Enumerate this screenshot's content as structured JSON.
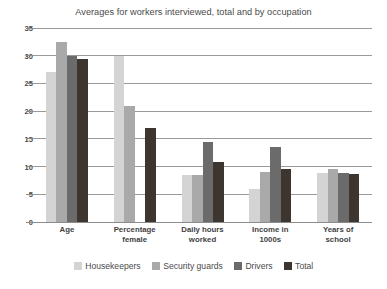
{
  "chart_data": {
    "type": "bar",
    "title": "Averages for workers interviewed, total and by occupation",
    "xlabel": "",
    "ylabel": "",
    "ylim": [
      0,
      35
    ],
    "ytick_step": 5,
    "yticks": [
      0,
      5,
      10,
      15,
      20,
      25,
      30,
      35
    ],
    "grid": true,
    "legend_position": "bottom",
    "orientation": "vertical",
    "grouped": true,
    "categories": [
      "Age",
      "Percentage female",
      "Daily hours worked",
      "Income in 1000s",
      "Years of school"
    ],
    "category_lines": [
      [
        "Age"
      ],
      [
        "Percentage",
        "female"
      ],
      [
        "Daily hours",
        "worked"
      ],
      [
        "Income in",
        "1000s"
      ],
      [
        "Years of",
        "school"
      ]
    ],
    "series": [
      {
        "name": "Housekeepers",
        "color": "#d4d4d4",
        "values": [
          27,
          30,
          8.5,
          6,
          8.8
        ]
      },
      {
        "name": "Security guards",
        "color": "#a9a9a9",
        "values": [
          32.5,
          21,
          8.5,
          9,
          9.5
        ]
      },
      {
        "name": "Drivers",
        "color": "#6b6b6b",
        "values": [
          30,
          0,
          14.5,
          13.5,
          8.8
        ]
      },
      {
        "name": "Total",
        "color": "#3d3530",
        "values": [
          29.5,
          17,
          10.8,
          9.5,
          8.7
        ]
      }
    ]
  },
  "colors": {
    "background": "#ffffff",
    "gridline": "#9a9a9a",
    "axis": "#8c8c8c",
    "text": "#4a4a4a"
  }
}
